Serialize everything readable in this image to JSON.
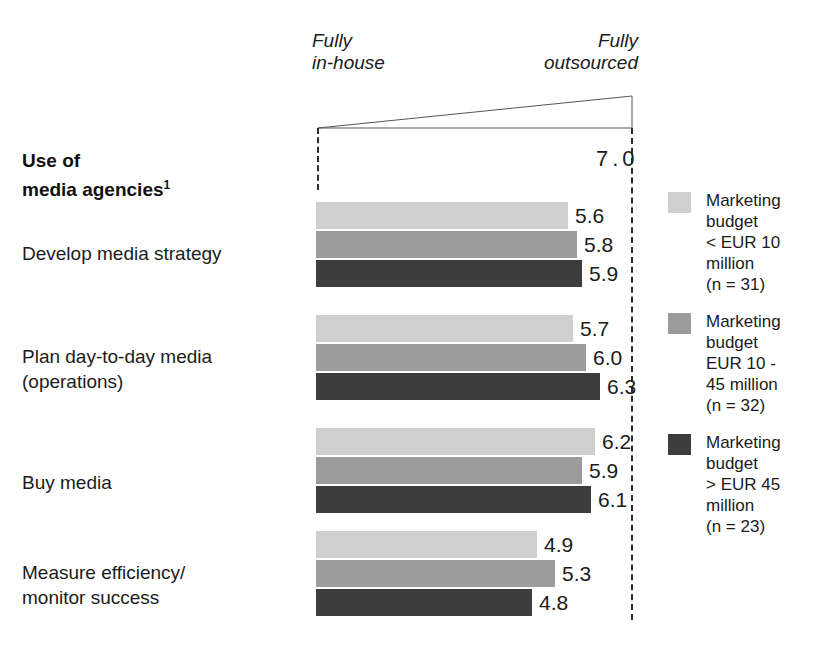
{
  "chart_data": {
    "type": "bar",
    "orientation": "horizontal",
    "title_footnote": "1",
    "xlabel": "",
    "ylabel": "",
    "xlim": [
      0,
      7.0
    ],
    "axis_max_label": "7.0",
    "grid": false,
    "legend_position": "right",
    "scale_left_label": "Fully\nin-house",
    "scale_right_label": "Fully\noutsourced",
    "categories": [
      "Develop media strategy",
      "Plan day-to-day media\n(operations)",
      "Buy media",
      "Measure efficiency/\nmonitor success"
    ],
    "series": [
      {
        "name": "Marketing\nbudget\n< EUR 10\nmillion\n(n = 31)",
        "color": "#cfcfcf",
        "values": [
          5.6,
          5.7,
          6.2,
          4.9
        ],
        "labels": [
          "5.6",
          "5.7",
          "6.2",
          "4.9"
        ]
      },
      {
        "name": "Marketing\nbudget\nEUR 10 -\n45 million\n(n = 32)",
        "color": "#9c9c9c",
        "values": [
          5.8,
          6.0,
          5.9,
          5.3
        ],
        "labels": [
          "5.8",
          "6.0",
          "5.9",
          "4.8"
        ]
      },
      {
        "name": "Marketing\nbudget\n> EUR 45\nmillion\n(n = 23)",
        "color": "#3d3d3d",
        "values": [
          5.9,
          6.3,
          6.1,
          4.8
        ],
        "labels": [
          "5.9",
          "6.3",
          "6.1",
          "4.8"
        ]
      }
    ],
    "value_labels": [
      [
        "5.6",
        "5.8",
        "5.9"
      ],
      [
        "5.7",
        "6.0",
        "6.3"
      ],
      [
        "6.2",
        "5.9",
        "6.1"
      ],
      [
        "4.9",
        "5.3",
        "4.8"
      ]
    ]
  },
  "title": {
    "line1": "Use of",
    "line2": "media agencies",
    "footnote": "1"
  },
  "scale": {
    "left": "Fully\nin-house",
    "right": "Fully\noutsourced",
    "max": "7.0"
  },
  "rows": [
    {
      "label": "Develop media strategy"
    },
    {
      "label": "Plan day-to-day media\n(operations)"
    },
    {
      "label": "Buy media"
    },
    {
      "label": "Measure efficiency/\nmonitor success"
    }
  ],
  "legend": {
    "items": [
      {
        "label": "Marketing\nbudget\n< EUR 10\nmillion\n(n = 31)",
        "color": "#cfcfcf"
      },
      {
        "label": "Marketing\nbudget\nEUR 10 -\n45 million\n(n = 32)",
        "color": "#9c9c9c"
      },
      {
        "label": "Marketing\nbudget\n> EUR 45\nmillion\n(n = 23)",
        "color": "#3d3d3d"
      }
    ]
  },
  "colors": {
    "series1": "#cfcfcf",
    "series2": "#9c9c9c",
    "series3": "#3d3d3d",
    "axis": "#2b2b2b",
    "text": "#1b1b1b",
    "background": "#ffffff"
  }
}
